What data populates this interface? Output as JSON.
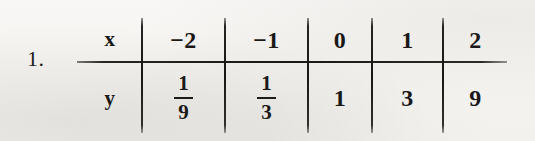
{
  "exercise": {
    "number_label": "1.",
    "row_header_top": "x",
    "row_header_bottom": "y"
  },
  "table": {
    "top_row": [
      {
        "display": "−2"
      },
      {
        "display": "−1"
      },
      {
        "display": "0"
      },
      {
        "display": "1"
      },
      {
        "display": "2"
      }
    ],
    "bottom_row": [
      {
        "type": "fraction",
        "numerator": "1",
        "denominator": "9"
      },
      {
        "type": "fraction",
        "numerator": "1",
        "denominator": "3"
      },
      {
        "type": "integer",
        "display": "1"
      },
      {
        "type": "integer",
        "display": "3"
      },
      {
        "type": "integer",
        "display": "9"
      }
    ]
  },
  "colors": {
    "ink": "#1a1917",
    "paper": "#f6f5f3"
  }
}
